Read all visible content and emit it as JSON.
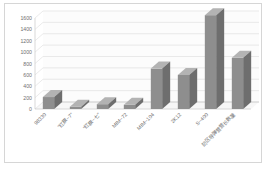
{
  "chart_data": {
    "type": "bar",
    "title": "",
    "subtitle": "",
    "xlabel": "",
    "ylabel": "",
    "categories": [
      "98330",
      "\"红旗−7\"",
      "\"红旗−七\"",
      "MIM−72",
      "MIM−104",
      "2K12",
      "S−400",
      "防区导弹营营长数量"
    ],
    "values": [
      210,
      40,
      85,
      75,
      710,
      600,
      1650,
      900
    ],
    "ylim": [
      0,
      1600
    ],
    "ytick_step": 200,
    "yticks": [
      0,
      200,
      400,
      600,
      800,
      1000,
      1200,
      1400,
      1600
    ],
    "grid": true,
    "legend": false,
    "legend_position": "none",
    "series": [
      {
        "name": "",
        "values": [
          210,
          40,
          85,
          75,
          710,
          600,
          1650,
          900
        ]
      }
    ]
  },
  "style": {
    "bar_front_color": "#8e8e8e",
    "bar_top_color": "#b3b3b3",
    "bar_side_color": "#6e6e6e",
    "grid_color": "#dcdcdc",
    "axis_color": "#c9c9c9",
    "tick_text_color": "#6f6f6f",
    "frame_border_color": "#d6d6d6",
    "plot_background": "#ffffff"
  }
}
